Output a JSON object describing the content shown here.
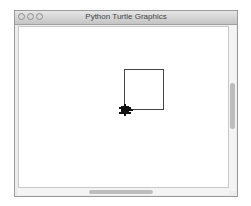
{
  "window": {
    "title": "Python Turtle Graphics",
    "buttons": [
      "close",
      "minimize",
      "zoom"
    ]
  },
  "canvas": {
    "background": "#ffffff",
    "drawing": {
      "shape": "square",
      "stroke": "#000000",
      "turtle_icon": "turtle-icon"
    }
  },
  "scrollbars": {
    "vertical": "vertical-scrollbar",
    "horizontal": "horizontal-scrollbar"
  }
}
